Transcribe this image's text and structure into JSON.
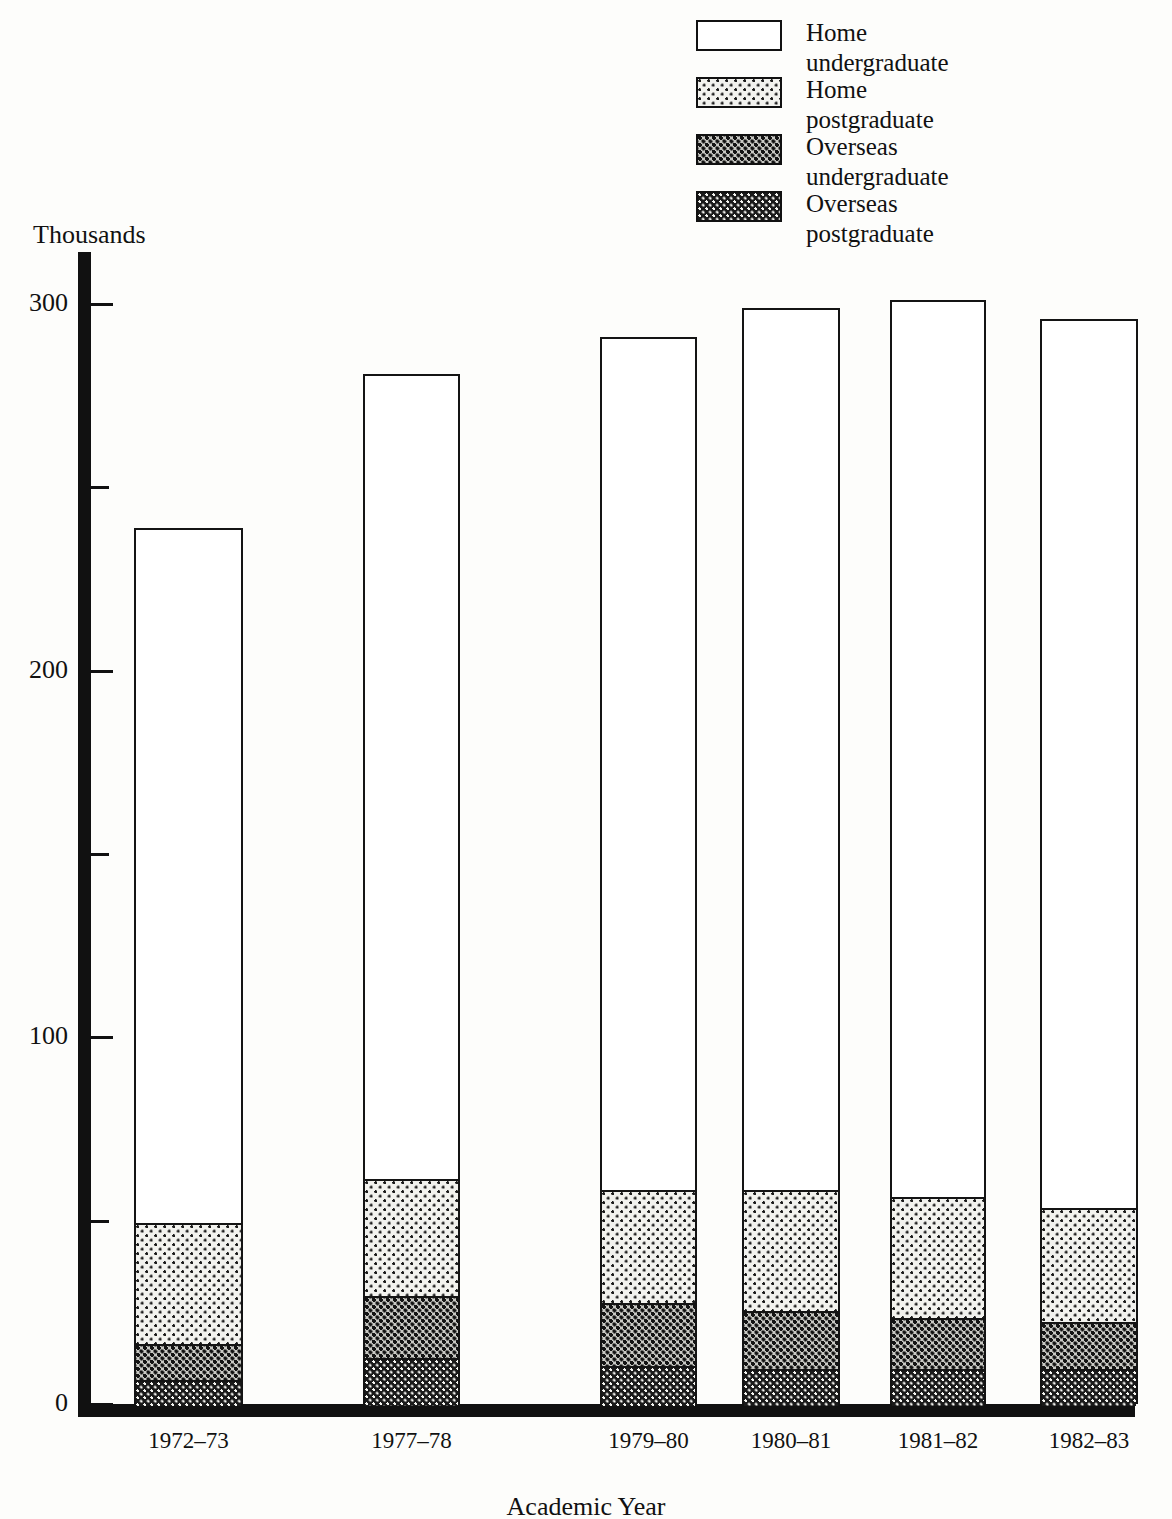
{
  "legend": {
    "items": [
      {
        "label": "Home\nundergraduate",
        "pattern": "white",
        "key": "home_undergraduate"
      },
      {
        "label": "Home\npostgraduate",
        "pattern": "light",
        "key": "home_postgraduate"
      },
      {
        "label": "Overseas\nundergraduate",
        "pattern": "medium",
        "key": "overseas_undergraduate"
      },
      {
        "label": "Overseas\npostgraduate",
        "pattern": "dark",
        "key": "overseas_postgraduate"
      }
    ]
  },
  "axes": {
    "y_unit_label": "Thousands",
    "x_title": "Academic Year",
    "y_major_ticks": [
      "0",
      "100",
      "200",
      "300"
    ],
    "y_minor_ticks": [
      "50",
      "150",
      "250"
    ]
  },
  "chart_data": {
    "type": "bar",
    "subtype": "stacked",
    "title": "",
    "xlabel": "Academic Year",
    "ylabel": "Thousands",
    "ylim": [
      0,
      310
    ],
    "yticks": [
      0,
      100,
      200,
      300
    ],
    "yticks_minor": [
      50,
      150,
      250
    ],
    "grid": false,
    "legend_position": "top-right",
    "stack_order_bottom_to_top": [
      "Overseas postgraduate",
      "Overseas undergraduate",
      "Home postgraduate",
      "Home undergraduate"
    ],
    "categories": [
      "1972–73",
      "1977–78",
      "1979–80",
      "1980–81",
      "1981–82",
      "1982–83"
    ],
    "series": [
      {
        "name": "Overseas postgraduate",
        "pattern": "dark",
        "values": [
          7,
          13,
          11,
          10,
          10,
          10
        ]
      },
      {
        "name": "Overseas undergraduate",
        "pattern": "medium",
        "values": [
          10,
          17,
          17,
          16,
          14,
          13
        ]
      },
      {
        "name": "Home postgraduate",
        "pattern": "light",
        "values": [
          33,
          32,
          31,
          33,
          33,
          31
        ]
      },
      {
        "name": "Home undergraduate",
        "pattern": "white",
        "values": [
          189,
          219,
          232,
          240,
          244,
          242
        ]
      }
    ],
    "totals": [
      239,
      281,
      291,
      299,
      301,
      296
    ]
  },
  "colors": {
    "ink": "#111111",
    "paper": "#fdfdfb",
    "light_fill": "#f2f2ee",
    "medium_fill": "#c9c9c4",
    "dark_fill": "#1a1a1a"
  }
}
